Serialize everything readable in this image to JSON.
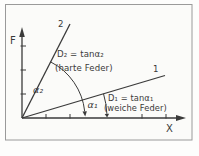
{
  "figure": {
    "colors": {
      "ink": "#3a3a3a",
      "frame": "#9a9a9a",
      "paper": "#fbfbf9"
    },
    "y_axis_label": "F",
    "x_axis_label": "X",
    "hard_spring": {
      "line_label": "2",
      "formula": "D₂ = tanα₂",
      "caption": "(harte Feder)",
      "angle_label": "α₂"
    },
    "soft_spring": {
      "line_label": "1",
      "formula": "D₁ = tanα₁",
      "caption": "(weiche Feder)",
      "angle_label": "α₁"
    }
  }
}
